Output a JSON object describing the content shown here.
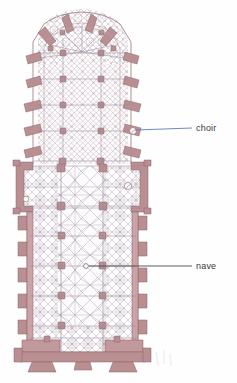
{
  "figure": {
    "type": "architectural-floor-plan",
    "background_color": "#fefefe",
    "canvas": {
      "width": 237,
      "height": 383
    }
  },
  "palette": {
    "wall_fill": "#b98f92",
    "wall_fill_light": "#c9a3a6",
    "wall_stroke": "#8d6266",
    "pier_fill": "#ad8084",
    "rib_line": "#9a8c9e",
    "rib_line_light": "#b3a8b8",
    "hatch_line": "#a89aa8",
    "floor_fill": "#fdfcfd",
    "label_text": "#3a3a3a",
    "choir_leader": "#5a7fb5",
    "nave_leader": "#4a4a4a"
  },
  "annotations": [
    {
      "id": "choir",
      "label": "choir",
      "text_x": 196,
      "text_y": 124,
      "leader_color": "#5a7fb5",
      "leader_from": {
        "x": 133,
        "y": 130
      },
      "leader_to": {
        "x": 192,
        "y": 128
      },
      "marker": {
        "x": 133,
        "y": 131,
        "r": 2.2
      }
    },
    {
      "id": "nave",
      "label": "nave",
      "text_x": 196,
      "text_y": 262,
      "leader_color": "#4a4a4a",
      "leader_from": {
        "x": 88,
        "y": 266
      },
      "leader_to": {
        "x": 192,
        "y": 266
      },
      "marker": {
        "x": 86,
        "y": 266,
        "r": 2.4
      }
    }
  ],
  "plan_parts": {
    "apse_chevet": "radiating chapels and flying buttresses at the top (liturgical east)",
    "choir": "bay-divided eastern arm with dense rib vaults",
    "transept": "shallow crossing arms with side chapels mid-plan",
    "nave": "five-bay central vessel running north-south on the page",
    "aisles": "flanking aisles with star-rib vault bays on both sides",
    "west_front": "twin-tower façade with portal block at the bottom",
    "buttresses": "stepped wall buttresses along the nave aisle walls"
  }
}
